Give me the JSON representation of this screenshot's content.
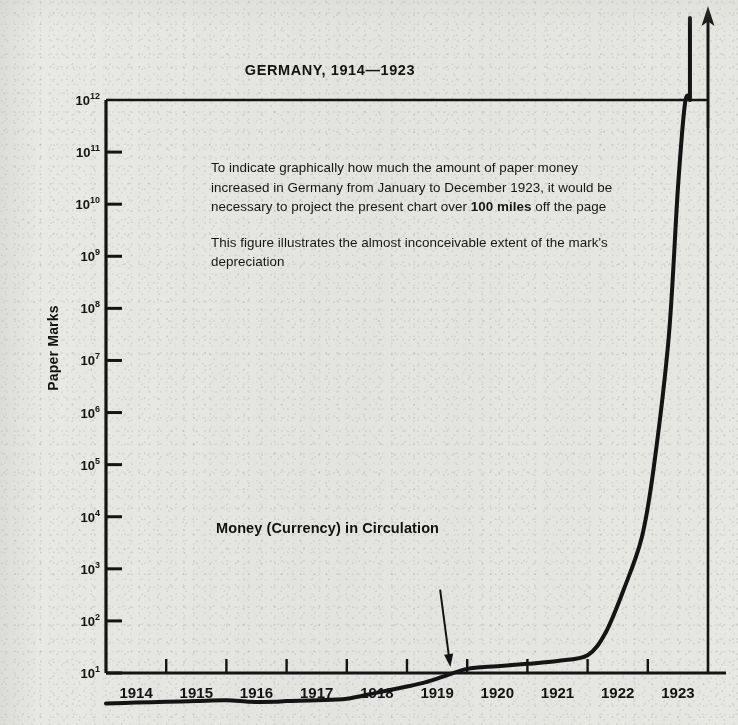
{
  "chart_data": {
    "type": "line",
    "title": "GERMANY, 1914—1923",
    "xlabel": "",
    "ylabel": "Paper Marks",
    "yscale": "log",
    "ylim": [
      10,
      1000000000000
    ],
    "xlim": [
      1914,
      1924
    ],
    "grid": false,
    "legend_position": "none",
    "y_tick_labels": [
      {
        "mantissa": "10",
        "exponent": "12",
        "value": 1000000000000
      },
      {
        "mantissa": "10",
        "exponent": "11",
        "value": 100000000000
      },
      {
        "mantissa": "10",
        "exponent": "10",
        "value": 10000000000
      },
      {
        "mantissa": "10",
        "exponent": "9",
        "value": 1000000000
      },
      {
        "mantissa": "10",
        "exponent": "8",
        "value": 100000000
      },
      {
        "mantissa": "10",
        "exponent": "7",
        "value": 10000000
      },
      {
        "mantissa": "10",
        "exponent": "6",
        "value": 1000000
      },
      {
        "mantissa": "10",
        "exponent": "5",
        "value": 100000
      },
      {
        "mantissa": "10",
        "exponent": "4",
        "value": 10000
      },
      {
        "mantissa": "10",
        "exponent": "3",
        "value": 1000
      },
      {
        "mantissa": "10",
        "exponent": "2",
        "value": 100
      },
      {
        "mantissa": "10",
        "exponent": "1",
        "value": 10
      }
    ],
    "x_tick_labels": [
      "1914",
      "1915",
      "1916",
      "1917",
      "1918",
      "1919",
      "1920",
      "1921",
      "1922",
      "1923"
    ],
    "series": [
      {
        "name": "Money (Currency) in Circulation",
        "points": [
          {
            "x": 1914.0,
            "y": 2.6
          },
          {
            "x": 1914.5,
            "y": 2.7
          },
          {
            "x": 1915.0,
            "y": 2.8
          },
          {
            "x": 1915.5,
            "y": 2.9
          },
          {
            "x": 1916.0,
            "y": 3.0
          },
          {
            "x": 1916.4,
            "y": 2.8
          },
          {
            "x": 1916.8,
            "y": 2.8
          },
          {
            "x": 1917.0,
            "y": 2.9
          },
          {
            "x": 1917.5,
            "y": 3.0
          },
          {
            "x": 1918.0,
            "y": 3.2
          },
          {
            "x": 1918.5,
            "y": 4.2
          },
          {
            "x": 1919.0,
            "y": 5.5
          },
          {
            "x": 1919.3,
            "y": 6.6
          },
          {
            "x": 1919.6,
            "y": 8.5
          },
          {
            "x": 1920.0,
            "y": 12.0
          },
          {
            "x": 1920.5,
            "y": 13.5
          },
          {
            "x": 1921.0,
            "y": 15.0
          },
          {
            "x": 1921.5,
            "y": 17.0
          },
          {
            "x": 1922.0,
            "y": 22.0
          },
          {
            "x": 1922.3,
            "y": 60.0
          },
          {
            "x": 1922.6,
            "y": 400.0
          },
          {
            "x": 1922.9,
            "y": 4000.0
          },
          {
            "x": 1923.1,
            "y": 90000.0
          },
          {
            "x": 1923.35,
            "y": 30000000.0
          },
          {
            "x": 1923.5,
            "y": 20000000000.0
          },
          {
            "x": 1923.62,
            "y": 900000000000.0
          },
          {
            "x": 1923.7,
            "y": 1000000000000.0
          }
        ]
      }
    ],
    "annotations": [
      {
        "name": "series-callout",
        "text": "Money (Currency) in Circulation",
        "arrow_from": {
          "x": 1919.55,
          "y": 400
        },
        "arrow_to": {
          "x": 1919.72,
          "y": 13
        }
      },
      {
        "name": "explanatory-note",
        "paragraph_1_part_1": "To indicate graphically how much the amount of paper money increased in Germany from January to December 1923, it would be necessary to project the present chart over ",
        "paragraph_1_bold": "100 miles",
        "paragraph_1_part_2": " off the page",
        "paragraph_2": "This figure illustrates the almost inconceivable extent of the mark's depreciation"
      }
    ],
    "axis_arrow": {
      "name": "off-chart-arrow",
      "direction": "up",
      "meaning": "curve continues beyond top of chart"
    },
    "colors": {
      "background": "#e9e9e6",
      "ink": "#141414",
      "curve": "#141414",
      "axis": "#141414"
    }
  }
}
